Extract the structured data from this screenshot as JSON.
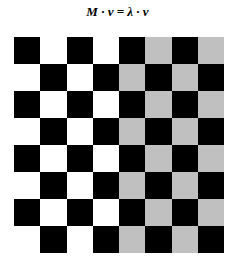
{
  "title": "M · v = λ · v",
  "board": {
    "rows": 8,
    "cols": 8,
    "colors": {
      "dark": "#000000",
      "light_left": "#ffffff",
      "light_right": "#c0c0c0"
    },
    "light_right_start_col": 4,
    "top_left": "dark"
  }
}
